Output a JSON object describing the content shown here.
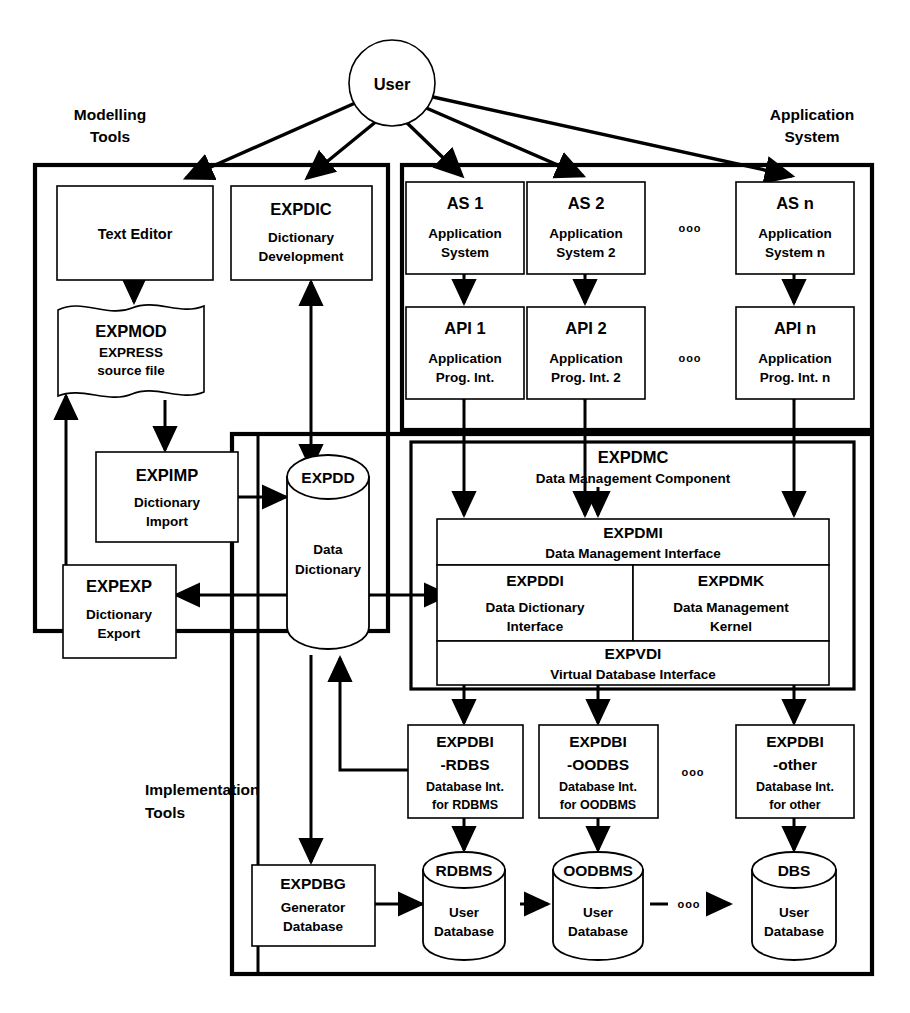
{
  "diagram": {
    "actor": {
      "label": "User"
    },
    "group_labels": {
      "modelling_tools": "Modelling\nTools",
      "modelling_tools_l1": "Modelling",
      "modelling_tools_l2": "Tools",
      "application_system_l1": "Application",
      "application_system_l2": "System",
      "implementation_tools_l1": "Implementation",
      "implementation_tools_l2": "Tools"
    },
    "ellipsis": "ooo",
    "nodes": {
      "text_editor": {
        "title": "Text Editor",
        "sub1": "",
        "sub2": ""
      },
      "expdic": {
        "title": "EXPDIC",
        "sub1": "Dictionary",
        "sub2": "Development"
      },
      "expmod": {
        "title": "EXPMOD",
        "sub1": "EXPRESS",
        "sub2": "source file"
      },
      "expimp": {
        "title": "EXPIMP",
        "sub1": "Dictionary",
        "sub2": "Import"
      },
      "expexp": {
        "title": "EXPEXP",
        "sub1": "Dictionary",
        "sub2": "Export"
      },
      "expdd": {
        "title": "EXPDD",
        "sub1": "Data",
        "sub2": "Dictionary"
      },
      "as1": {
        "title": "AS 1",
        "sub1": "Application",
        "sub2": "System"
      },
      "as2": {
        "title": "AS 2",
        "sub1": "Application",
        "sub2": "System 2"
      },
      "asn": {
        "title": "AS n",
        "sub1": "Application",
        "sub2": "System  n"
      },
      "api1": {
        "title": "API 1",
        "sub1": "Application",
        "sub2": "Prog. Int."
      },
      "api2": {
        "title": "API 2",
        "sub1": "Application",
        "sub2": "Prog. Int. 2"
      },
      "apin": {
        "title": "API n",
        "sub1": "Application",
        "sub2": "Prog. Int. n"
      },
      "expdmc": {
        "title": "EXPDMC",
        "sub1": "Data Management Component"
      },
      "expdmi": {
        "title": "EXPDMI",
        "sub1": "Data Management Interface"
      },
      "expddi": {
        "title": "EXPDDI",
        "sub1": "Data Dictionary",
        "sub2": "Interface"
      },
      "expdmk": {
        "title": "EXPDMK",
        "sub1": "Data Management",
        "sub2": "Kernel"
      },
      "expvdi": {
        "title": "EXPVDI",
        "sub1": "Virtual Database Interface"
      },
      "expdbi_rdbs": {
        "title": "EXPDBI",
        "sub0": "-RDBS",
        "sub1": "Database Int.",
        "sub2": "for RDBMS"
      },
      "expdbi_oodbs": {
        "title": "EXPDBI",
        "sub0": "-OODBS",
        "sub1": "Database Int.",
        "sub2": "for OODBMS"
      },
      "expdbi_other": {
        "title": "EXPDBI",
        "sub0": "-other",
        "sub1": "Database Int.",
        "sub2": "for other"
      },
      "expdbg": {
        "title": "EXPDBG",
        "sub1": "Generator",
        "sub2": "Database"
      },
      "rdbms": {
        "title": "RDBMS",
        "sub1": "User",
        "sub2": "Database"
      },
      "oodbms": {
        "title": "OODBMS",
        "sub1": "User",
        "sub2": "Database"
      },
      "dbs": {
        "title": "DBS",
        "sub1": "User",
        "sub2": "Database"
      }
    },
    "colors": {
      "stroke": "#000000",
      "fill": "#ffffff"
    }
  }
}
